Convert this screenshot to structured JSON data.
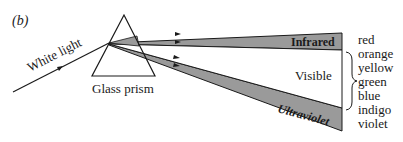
{
  "panel_label": "(b)",
  "incident_label": "White light",
  "prism_label": "Glass prism",
  "bands": {
    "infrared": "Infrared",
    "visible": "Visible",
    "ultraviolet": "Ultraviolet"
  },
  "colors_list": [
    "red",
    "orange",
    "yellow",
    "green",
    "blue",
    "indigo",
    "violet"
  ],
  "colors": {
    "band_fill": "#9a9a9a",
    "line": "#1a1a1a",
    "background": "#ffffff"
  }
}
